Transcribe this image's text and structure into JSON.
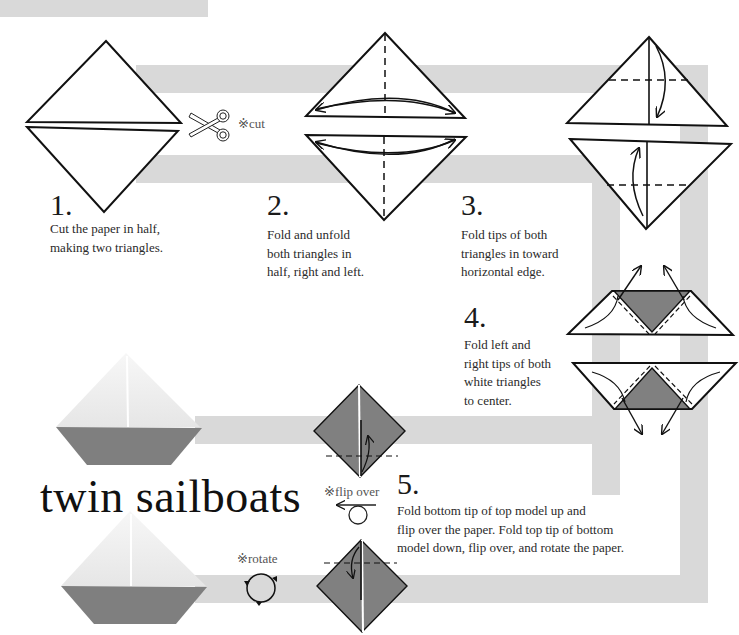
{
  "title": "twin sailboats",
  "colors": {
    "band": "#d9d9d9",
    "paper_colored": "#7a7a7a",
    "paper_white": "#ffffff",
    "line": "#111111"
  },
  "notes": {
    "cut": "※cut",
    "flip_over": "※flip over",
    "rotate": "※rotate"
  },
  "steps": [
    {
      "number": "1.",
      "text": "Cut the paper in half,\nmaking two triangles."
    },
    {
      "number": "2.",
      "text": "Fold and unfold\nboth triangles in\nhalf, right and left."
    },
    {
      "number": "3.",
      "text": "Fold tips of both\ntriangles in toward\nhorizontal edge."
    },
    {
      "number": "4.",
      "text": "Fold left and\nright tips of both\nwhite triangles\nto center."
    },
    {
      "number": "5.",
      "text": "Fold bottom tip of top model up and\nflip over the paper. Fold top tip of bottom\nmodel down, flip over, and rotate the paper."
    }
  ],
  "icons": {
    "scissors": "scissors-icon",
    "flip": "flip-over-icon",
    "rotate": "rotate-icon"
  }
}
